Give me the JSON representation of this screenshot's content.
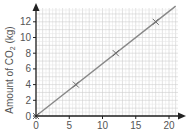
{
  "chart_data": {
    "type": "line",
    "title": "",
    "xlabel": "",
    "ylabel": "Amount of CO₂ (kg)",
    "ylabel_parts": {
      "pre": "Amount of CO",
      "sub": "2",
      "post": " (kg)"
    },
    "xlim": [
      0,
      21.5
    ],
    "ylim": [
      0,
      14
    ],
    "x_ticks": [
      0,
      5,
      10,
      15,
      20
    ],
    "y_ticks": [
      0,
      2,
      4,
      6,
      8,
      10,
      12
    ],
    "grid": true,
    "legend": null,
    "series": [
      {
        "name": "CO2 amount",
        "marker": "x",
        "points": [
          {
            "x": 0,
            "y": 0
          },
          {
            "x": 6,
            "y": 4
          },
          {
            "x": 12,
            "y": 8
          },
          {
            "x": 18,
            "y": 12
          }
        ],
        "trend_line": {
          "slope": 0.6667,
          "intercept": 0,
          "x_end": 21
        }
      }
    ],
    "colors": {
      "line": "#888888",
      "axis": "#222222",
      "grid_major": "#cfcfcf",
      "grid_minor": "#e6e6e6",
      "text": "#555555"
    }
  }
}
